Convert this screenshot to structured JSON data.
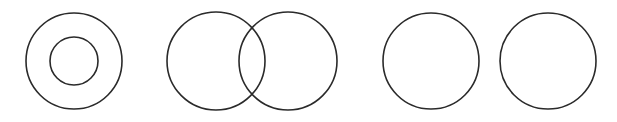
{
  "diagram": {
    "stroke_color": "#2a2a2a",
    "background": "#ffffff",
    "groups": [
      {
        "name": "concentric",
        "circles": [
          {
            "cx": 74,
            "cy": 61,
            "r": 48
          },
          {
            "cx": 74,
            "cy": 61,
            "r": 24
          }
        ]
      },
      {
        "name": "intersecting",
        "circles": [
          {
            "cx": 216,
            "cy": 61,
            "r": 49
          },
          {
            "cx": 288,
            "cy": 61,
            "r": 49
          }
        ]
      },
      {
        "name": "separate",
        "circles": [
          {
            "cx": 431,
            "cy": 61,
            "r": 48
          },
          {
            "cx": 548,
            "cy": 61,
            "r": 48
          }
        ]
      }
    ]
  }
}
